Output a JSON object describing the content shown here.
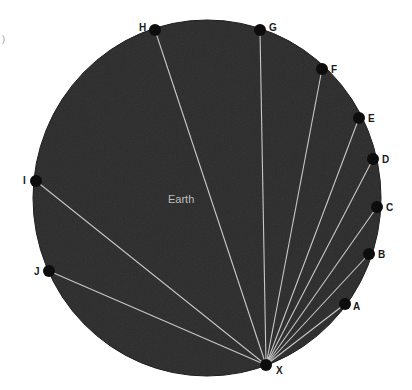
{
  "diagram": {
    "title": "Earth",
    "colors": {
      "earth_fill": "#2b2b2b",
      "earth_edge": "#1a1a1a",
      "ray": "#c8c8c8",
      "dot": "#0d0d0d",
      "label": "#1a1a1a",
      "earth_label": "#bdbdbd"
    },
    "earth": {
      "cx": 207,
      "cy": 198,
      "rx": 174,
      "ry": 178
    },
    "origin": {
      "id": "X",
      "label": "X",
      "x": 266,
      "y": 365,
      "lx": 276,
      "ly": 374
    },
    "points": [
      {
        "id": "A",
        "label": "A",
        "x": 345,
        "y": 304,
        "lx": 353,
        "ly": 310
      },
      {
        "id": "B",
        "label": "B",
        "x": 369,
        "y": 254,
        "lx": 378,
        "ly": 258
      },
      {
        "id": "C",
        "label": "C",
        "x": 377,
        "y": 207,
        "lx": 386,
        "ly": 211
      },
      {
        "id": "D",
        "label": "D",
        "x": 373,
        "y": 159,
        "lx": 382,
        "ly": 163
      },
      {
        "id": "E",
        "label": "E",
        "x": 359,
        "y": 118,
        "lx": 368,
        "ly": 122
      },
      {
        "id": "F",
        "label": "F",
        "x": 322,
        "y": 69,
        "lx": 331,
        "ly": 73
      },
      {
        "id": "G",
        "label": "G",
        "x": 260,
        "y": 30,
        "lx": 269,
        "ly": 31
      },
      {
        "id": "H",
        "label": "H",
        "x": 155,
        "y": 30,
        "lx": 139,
        "ly": 31
      },
      {
        "id": "I",
        "label": "I",
        "x": 36,
        "y": 181,
        "lx": 23,
        "ly": 184
      },
      {
        "id": "J",
        "label": "J",
        "x": 49,
        "y": 271,
        "lx": 34,
        "ly": 275
      }
    ],
    "earth_label_pos": {
      "x": 168,
      "y": 203
    },
    "stray_mark": ")"
  }
}
